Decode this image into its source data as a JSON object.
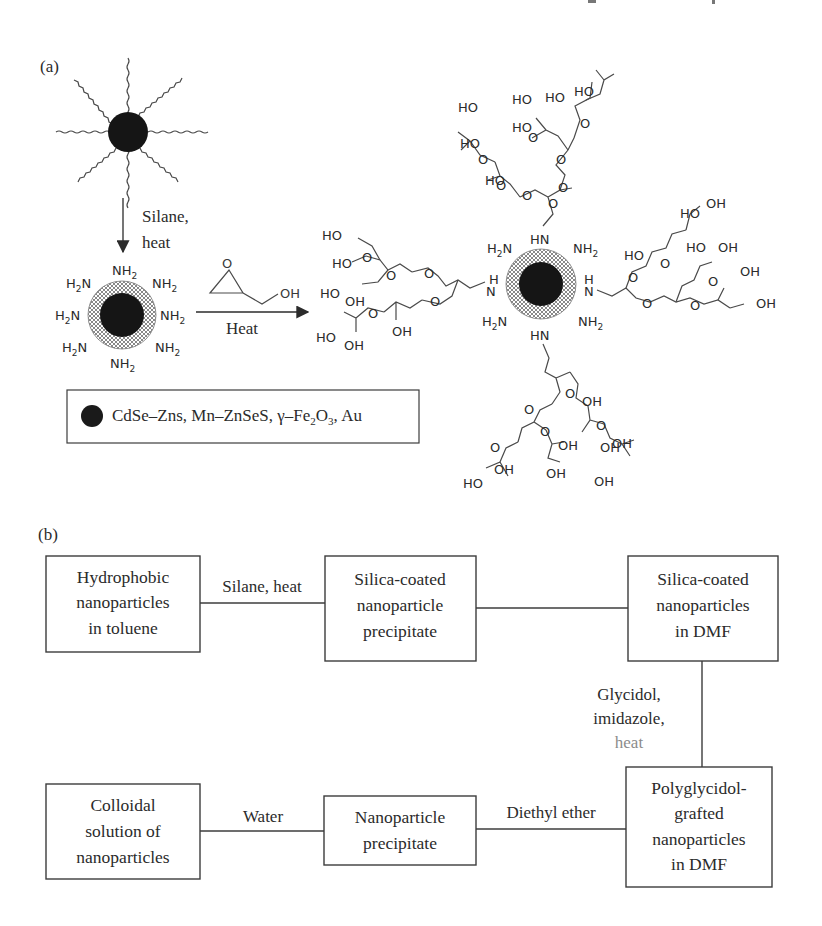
{
  "panel_a": {
    "label": "(a)",
    "step1": {
      "reagent_line1": "Silane,",
      "reagent_line2": "heat"
    },
    "amine_particle": {
      "groups": [
        "NH2",
        "NH2",
        "NH2",
        "NH2",
        "NH2",
        "H2N",
        "H2N",
        "H2N"
      ]
    },
    "step2": {
      "reagent": "glycidol",
      "epoxide_o": "O",
      "epoxide_oh": "OH",
      "condition": "Heat"
    },
    "legend": {
      "text_parts": [
        "CdSe–Zns, Mn–ZnSeS, γ–Fe",
        "2",
        "O",
        "3",
        ", Au"
      ],
      "dot_color": "#1a1a1a"
    },
    "product": {
      "core_color": "#151515",
      "shell_color": "#9a9a9a",
      "labels": {
        "HO": "HO",
        "OH": "OH",
        "O": "O",
        "HN": "HN",
        "NH": "N",
        "H": "H",
        "NH2": "NH",
        "H2N": "H",
        "sub2": "2"
      }
    }
  },
  "panel_b": {
    "label": "(b)",
    "boxes": [
      {
        "id": "hydrophobic",
        "lines": [
          "Hydrophobic",
          "nanoparticles",
          "in toluene"
        ]
      },
      {
        "id": "silica-precipitate",
        "lines": [
          "Silica-coated",
          "nanoparticle",
          "precipitate"
        ]
      },
      {
        "id": "silica-dmf",
        "lines": [
          "Silica-coated",
          "nanoparticles",
          "in DMF"
        ]
      },
      {
        "id": "polyglycidol-dmf",
        "lines": [
          "Polyglycidol-",
          "grafted",
          "nanoparticles",
          "in DMF"
        ]
      },
      {
        "id": "np-precipitate",
        "lines": [
          "Nanoparticle",
          "precipitate"
        ]
      },
      {
        "id": "colloidal",
        "lines": [
          "Colloidal",
          "solution of",
          "nanoparticles"
        ]
      }
    ],
    "edges": [
      {
        "from": "hydrophobic",
        "to": "silica-precipitate",
        "label": "Silane, heat"
      },
      {
        "from": "silica-precipitate",
        "to": "silica-dmf",
        "label": ""
      },
      {
        "from": "silica-dmf",
        "to": "polyglycidol-dmf",
        "label_lines": [
          "Glycidol,",
          "imidazole,",
          "heat"
        ]
      },
      {
        "from": "polyglycidol-dmf",
        "to": "np-precipitate",
        "label": "Diethyl ether"
      },
      {
        "from": "np-precipitate",
        "to": "colloidal",
        "label": "Water"
      }
    ]
  }
}
